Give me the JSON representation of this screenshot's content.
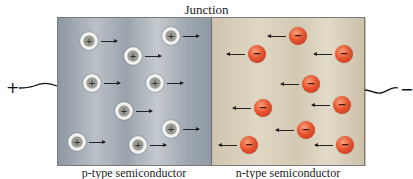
{
  "title": "Junction",
  "panels": {
    "left_label": "p-type semiconductor",
    "right_label": "n-type semiconductor"
  },
  "terminals": {
    "left": "+",
    "right": "−"
  },
  "particles": {
    "hole_symbol": "+",
    "electron_symbol": "−",
    "holes": [
      {
        "x": 89,
        "y": 41
      },
      {
        "x": 171,
        "y": 36
      },
      {
        "x": 133,
        "y": 56
      },
      {
        "x": 92,
        "y": 83
      },
      {
        "x": 155,
        "y": 83
      },
      {
        "x": 124,
        "y": 111
      },
      {
        "x": 171,
        "y": 129
      },
      {
        "x": 77,
        "y": 142
      },
      {
        "x": 138,
        "y": 145
      }
    ],
    "electrons": [
      {
        "x": 298,
        "y": 36
      },
      {
        "x": 257,
        "y": 54
      },
      {
        "x": 344,
        "y": 54
      },
      {
        "x": 311,
        "y": 84
      },
      {
        "x": 263,
        "y": 108
      },
      {
        "x": 342,
        "y": 105
      },
      {
        "x": 306,
        "y": 130
      },
      {
        "x": 249,
        "y": 145
      },
      {
        "x": 345,
        "y": 145
      }
    ]
  },
  "colors": {
    "p_region": "#a9b1b9",
    "n_region": "#d9cfbb",
    "electron": "#e8552f",
    "hole": "#f2f2ee"
  }
}
